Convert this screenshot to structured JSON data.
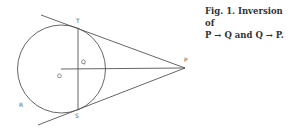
{
  "figure": {
    "labels": {
      "T": "T",
      "Q": "Q",
      "O": "O",
      "P": "P",
      "R": "R",
      "S": "S"
    },
    "stroke_color": "#555555"
  },
  "caption": {
    "line1": "Fig. 1. Inversion of",
    "line2": "P → Q and Q → P."
  }
}
